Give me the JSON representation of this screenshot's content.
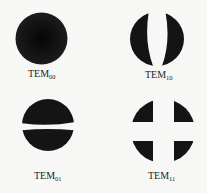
{
  "figure": {
    "colors": {
      "background": "#f7f7f5",
      "mode_fill": "#141414",
      "label": "#222222"
    },
    "modes": [
      {
        "id": "TEM00",
        "base": "TEM",
        "sub": "00"
      },
      {
        "id": "TEM10",
        "base": "TEM",
        "sub": "10"
      },
      {
        "id": "TEM01",
        "base": "TEM",
        "sub": "01"
      },
      {
        "id": "TEM11",
        "base": "TEM",
        "sub": "11"
      }
    ]
  }
}
